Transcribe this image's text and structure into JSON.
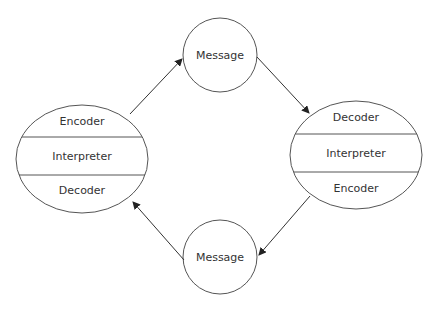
{
  "diagram": {
    "type": "communication-cycle",
    "colors": {
      "stroke": "#555555",
      "text": "#333333",
      "background": "#ffffff"
    },
    "left_node": {
      "sections": [
        "Encoder",
        "Interpreter",
        "Decoder"
      ]
    },
    "right_node": {
      "sections": [
        "Decoder",
        "Interpreter",
        "Encoder"
      ]
    },
    "top_message": {
      "label": "Message"
    },
    "bottom_message": {
      "label": "Message"
    },
    "edges": [
      {
        "from": "left_node",
        "to": "top_message"
      },
      {
        "from": "top_message",
        "to": "right_node"
      },
      {
        "from": "right_node",
        "to": "bottom_message"
      },
      {
        "from": "bottom_message",
        "to": "left_node"
      }
    ]
  }
}
